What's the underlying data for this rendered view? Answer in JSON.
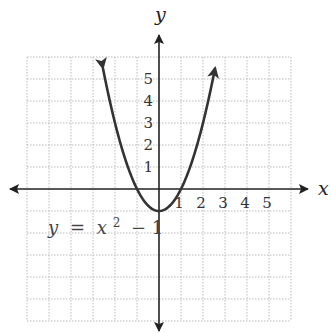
{
  "chart_data": {
    "type": "line",
    "title": "",
    "xlabel": "x",
    "ylabel": "y",
    "xlim": [
      -6,
      6
    ],
    "ylim": [
      -6,
      6
    ],
    "grid": true,
    "grid_style": "dotted",
    "x_ticks": [
      "1",
      "2",
      "3",
      "4",
      "5"
    ],
    "y_ticks": [
      "1",
      "2",
      "3",
      "4",
      "5"
    ],
    "series": [
      {
        "name": "y = x² − 1",
        "equation": "y = x^2 - 1",
        "x": [
          -2.5,
          -2,
          -1.5,
          -1,
          -0.5,
          0,
          0.5,
          1,
          1.5,
          2,
          2.5
        ],
        "y": [
          5.25,
          3,
          1.25,
          0,
          -0.75,
          -1,
          -0.75,
          0,
          1.25,
          3,
          5.25
        ],
        "arrows_at_ends": true
      }
    ],
    "annotations": [
      {
        "text": "y = x² − 1",
        "position": [
          -5,
          -2
        ]
      }
    ]
  },
  "labels": {
    "x_axis": "x",
    "y_axis": "y",
    "equation_y": "y",
    "equation_eq": "=",
    "equation_x": "x",
    "equation_exp": "2",
    "equation_rest": "− 1"
  },
  "colors": {
    "axis": "#222222",
    "curve": "#333333",
    "grid": "#bbbbbb",
    "background": "#ffffff"
  }
}
